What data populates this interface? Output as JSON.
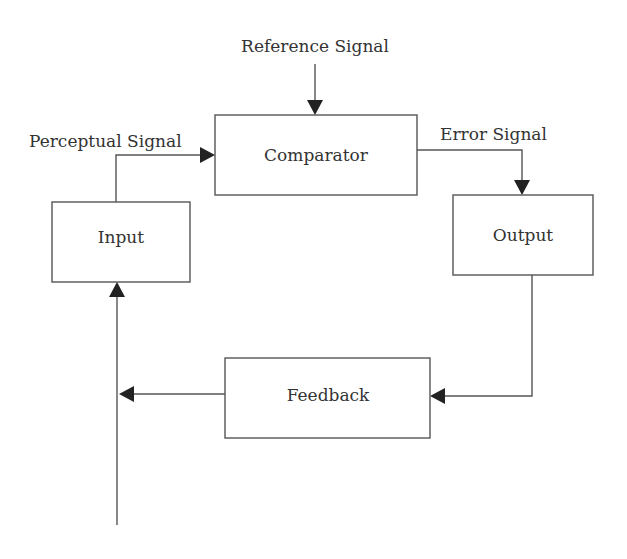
{
  "diagram": {
    "blocks": {
      "comparator": "Comparator",
      "input": "Input",
      "output": "Output",
      "feedback": "Feedback"
    },
    "signals": {
      "reference": "Reference Signal",
      "perceptual": "Perceptual Signal",
      "error": "Error Signal"
    },
    "colors": {
      "stroke": "#555555",
      "arrowhead": "#222222",
      "text": "#333333",
      "background": "#ffffff"
    }
  }
}
